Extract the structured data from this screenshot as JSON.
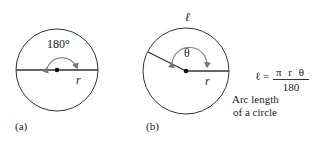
{
  "figure": {
    "panel_a": {
      "label": "(a)",
      "angle_label": "180°",
      "radius_label": "r"
    },
    "panel_b": {
      "label": "(b)",
      "angle_label": "θ",
      "radius_label": "r",
      "arc_label": "ℓ"
    },
    "formula": {
      "lhs": "ℓ =",
      "numerator": "π r θ",
      "denominator": "180"
    },
    "caption": {
      "line1": "Arc length",
      "line2": "of a circle"
    },
    "colors": {
      "stroke": "#333333",
      "arc_arrow": "#888888",
      "background": "#ffffff"
    }
  }
}
